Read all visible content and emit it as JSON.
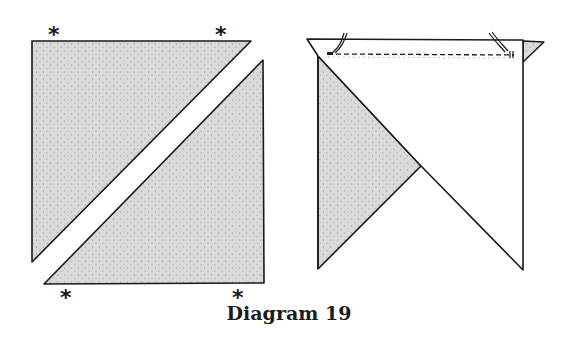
{
  "caption": "Diagram 19",
  "colors": {
    "fabric_shaded": "#d9d9d9",
    "fabric_white": "#ffffff",
    "outline": "#1a1a1a",
    "stipple": "#8a8a8a"
  },
  "marks": {
    "asterisk": "*"
  },
  "left_figure": {
    "description": "Square cut diagonally into two shaded triangles, separated",
    "upper_triangle": [
      [
        32,
        41
      ],
      [
        251,
        41
      ],
      [
        32,
        262
      ]
    ],
    "lower_triangle": [
      [
        263,
        60
      ],
      [
        264,
        283
      ],
      [
        44,
        284
      ]
    ],
    "asterisks": [
      {
        "x": 55,
        "y": 37
      },
      {
        "x": 222,
        "y": 37
      },
      {
        "x": 67,
        "y": 300
      },
      {
        "x": 239,
        "y": 300
      }
    ]
  },
  "right_figure": {
    "description": "Shaded triangle with white triangle placed on top, right sides together, stitched along top edge with pins",
    "white_triangle": [
      [
        307,
        39
      ],
      [
        523,
        40
      ],
      [
        523,
        270
      ],
      [
        421,
        166
      ],
      [
        318,
        56
      ]
    ],
    "shaded_triangle": [
      [
        318,
        56
      ],
      [
        421,
        166
      ],
      [
        318,
        269
      ]
    ],
    "shaded_tip": [
      [
        523,
        41
      ],
      [
        544,
        42
      ],
      [
        523,
        62
      ]
    ],
    "stitch_line": {
      "x1": 328,
      "y1": 54,
      "x2": 514,
      "y2": 55
    },
    "pins": [
      {
        "x": 340,
        "y": 40
      },
      {
        "x": 500,
        "y": 40
      }
    ]
  }
}
